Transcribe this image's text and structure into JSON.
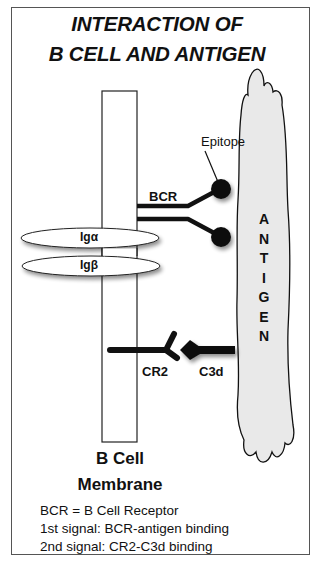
{
  "title": {
    "line1": "INTERACTION OF",
    "line2": "B CELL AND ANTIGEN"
  },
  "labels": {
    "epitope": "Epitope",
    "bcr": "BCR",
    "ig_alpha": "Igα",
    "ig_beta": "Igβ",
    "cr2": "CR2",
    "c3d": "C3d",
    "membrane_line1": "B Cell",
    "membrane_line2": "Membrane",
    "antigen_letters": [
      "A",
      "N",
      "T",
      "I",
      "G",
      "E",
      "N"
    ]
  },
  "legend": [
    "BCR = B Cell Receptor",
    "1st signal: BCR-antigen binding",
    "2nd signal: CR2-C3d binding"
  ],
  "colors": {
    "ink": "#111111",
    "antigen_fill": "#e9e9e9",
    "frame": "#555555"
  }
}
